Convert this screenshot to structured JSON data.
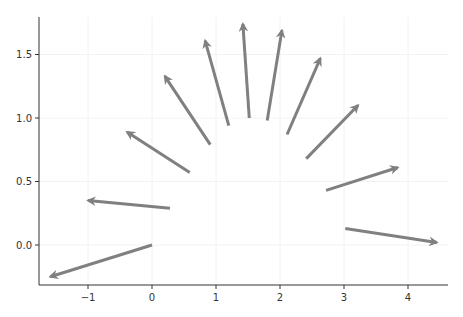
{
  "chart_data": {
    "type": "quiver",
    "title": "",
    "xlabel": "",
    "ylabel": "",
    "xlim": [
      -1.75,
      4.6
    ],
    "ylim": [
      -0.32,
      1.8
    ],
    "grid": true,
    "legend": null,
    "x_ticks": [
      -1,
      0,
      1,
      2,
      3,
      4
    ],
    "x_tick_labels": [
      "−1",
      "0",
      "1",
      "2",
      "3",
      "4"
    ],
    "y_ticks": [
      0.0,
      0.5,
      1.0,
      1.5
    ],
    "y_tick_labels": [
      "0.0",
      "0.5",
      "1.0",
      "1.5"
    ],
    "arrow_color": "#808080",
    "arrows": [
      {
        "x0": 0.0,
        "y0": 0.0,
        "x1": -1.59,
        "y1": -0.25
      },
      {
        "x0": 0.28,
        "y0": 0.29,
        "x1": -1.0,
        "y1": 0.35
      },
      {
        "x0": 0.59,
        "y0": 0.57,
        "x1": -0.39,
        "y1": 0.89
      },
      {
        "x0": 0.91,
        "y0": 0.79,
        "x1": 0.2,
        "y1": 1.33
      },
      {
        "x0": 1.2,
        "y0": 0.94,
        "x1": 0.83,
        "y1": 1.61
      },
      {
        "x0": 1.52,
        "y0": 1.0,
        "x1": 1.42,
        "y1": 1.74
      },
      {
        "x0": 1.8,
        "y0": 0.98,
        "x1": 2.03,
        "y1": 1.69
      },
      {
        "x0": 2.11,
        "y0": 0.87,
        "x1": 2.63,
        "y1": 1.47
      },
      {
        "x0": 2.41,
        "y0": 0.68,
        "x1": 3.22,
        "y1": 1.1
      },
      {
        "x0": 2.72,
        "y0": 0.43,
        "x1": 3.84,
        "y1": 0.61
      },
      {
        "x0": 3.02,
        "y0": 0.13,
        "x1": 4.45,
        "y1": 0.02
      }
    ]
  }
}
